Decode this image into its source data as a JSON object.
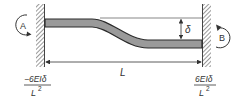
{
  "diagram": {
    "type": "fixed-fixed beam with end displacement",
    "moment_left": {
      "label": "A",
      "direction": "counterclockwise"
    },
    "moment_right": {
      "label": "B",
      "direction": "clockwise"
    },
    "displacement_label": "δ",
    "length_label": "L",
    "reaction_left": {
      "numerator": "−6EIδ",
      "denominator": "L",
      "denominator_exp": "2"
    },
    "reaction_right": {
      "numerator": "6EIδ",
      "denominator": "L",
      "denominator_exp": "2"
    }
  },
  "colors": {
    "beam_fill": "#9a9a9a",
    "beam_stroke": "#333333",
    "wall_hatch": "#555555",
    "line": "#333333"
  }
}
